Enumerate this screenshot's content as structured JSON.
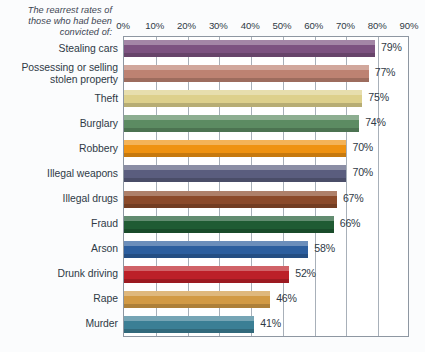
{
  "caption": "The rearrest rates of those who had been convicted of:",
  "chart_data": {
    "type": "bar",
    "orientation": "horizontal",
    "title": "",
    "subtitle": "The rearrest rates of those who had been convicted of:",
    "xlabel": "",
    "ylabel": "",
    "xlim": [
      0,
      90
    ],
    "grid": true,
    "legend": "none",
    "xticks": [
      "0%",
      "10%",
      "20%",
      "30%",
      "40%",
      "50%",
      "60%",
      "70%",
      "80%",
      "90%"
    ],
    "xtick_values": [
      0,
      10,
      20,
      30,
      40,
      50,
      60,
      70,
      80,
      90
    ],
    "categories": [
      "Stealing cars",
      "Possessing or selling stolen property",
      "Theft",
      "Burglary",
      "Robbery",
      "Illegal weapons",
      "Illegal drugs",
      "Fraud",
      "Arson",
      "Drunk driving",
      "Rape",
      "Murder"
    ],
    "values": [
      79,
      77,
      75,
      74,
      70,
      70,
      67,
      66,
      58,
      52,
      46,
      41
    ],
    "value_labels": [
      "79%",
      "77%",
      "75%",
      "74%",
      "70%",
      "70%",
      "67%",
      "66%",
      "58%",
      "52%",
      "46%",
      "41%"
    ],
    "bar_colors": [
      "#7c5280",
      "#bd8272",
      "#ddd08c",
      "#5c8b62",
      "#ef9211",
      "#5a5d7e",
      "#8b4a2a",
      "#1f5b33",
      "#2c5e9e",
      "#bc2028",
      "#d29a45",
      "#3b7f95"
    ],
    "axis_color": "#8e97a2",
    "gridline_color": "#a8b0b9",
    "background_color": "#fbfcfd",
    "plot_background_color": "#ffffff",
    "text_color": "#2f3a46"
  }
}
